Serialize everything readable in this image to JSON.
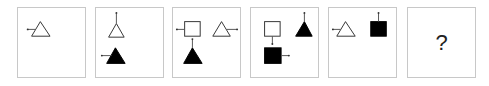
{
  "puzzle": {
    "type": "figure-sequence",
    "panels": [
      {
        "index": 1,
        "shapes": [
          {
            "shape": "triangle",
            "fill": "outline",
            "tail": "left"
          }
        ]
      },
      {
        "index": 2,
        "shapes": [
          {
            "shape": "triangle",
            "fill": "outline",
            "tail": "up"
          },
          {
            "shape": "triangle",
            "fill": "black",
            "tail": "left"
          }
        ]
      },
      {
        "index": 3,
        "shapes": [
          {
            "shape": "square",
            "fill": "outline",
            "tail": "left"
          },
          {
            "shape": "triangle",
            "fill": "outline",
            "tail": "right"
          },
          {
            "shape": "triangle",
            "fill": "black",
            "tail": "up"
          }
        ]
      },
      {
        "index": 4,
        "shapes": [
          {
            "shape": "square",
            "fill": "outline",
            "tail": "down"
          },
          {
            "shape": "triangle",
            "fill": "black",
            "tail": "up"
          },
          {
            "shape": "square",
            "fill": "black",
            "tail": "right"
          }
        ]
      },
      {
        "index": 5,
        "shapes": [
          {
            "shape": "triangle",
            "fill": "outline",
            "tail": "left"
          },
          {
            "shape": "square",
            "fill": "black",
            "tail": "up"
          }
        ]
      },
      {
        "index": 6,
        "answer": "?"
      }
    ],
    "colors": {
      "stroke": "#333333",
      "fill_black": "#000000",
      "border": "#c8c8c8"
    }
  }
}
